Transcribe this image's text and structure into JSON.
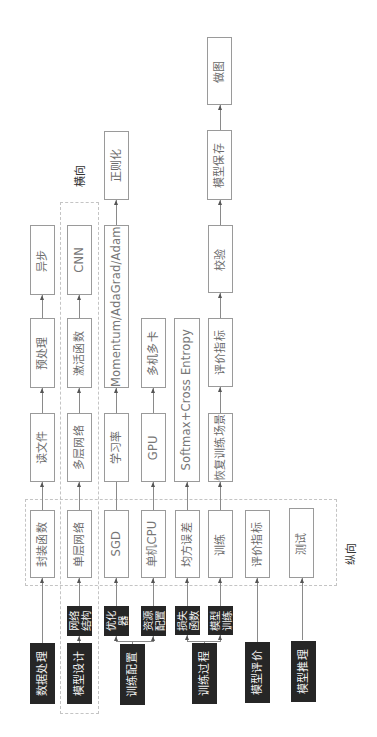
{
  "direction_labels": {
    "horizontal": "横向",
    "vertical": "纵向"
  },
  "columns": [
    {
      "category": "数据处理",
      "steps": [
        "封装函数",
        "读文件",
        "预处理",
        "异步"
      ]
    },
    {
      "category": "模型设计",
      "sub": "网络结构",
      "steps": [
        "单层网络",
        "多层网络",
        "激活函数",
        "CNN"
      ]
    },
    {
      "category": "训练配置",
      "sub": "优化器",
      "steps": [
        "SGD",
        "学习率",
        "Momentum/AdaGrad/Adam",
        "正则化"
      ]
    },
    {
      "category": "训练配置",
      "sub": "资源配置",
      "steps": [
        "单机CPU",
        "GPU",
        "多机多卡"
      ]
    },
    {
      "category": "训练过程",
      "sub": "损失函数",
      "steps": [
        "均方误差",
        "Softmax+Cross Entropy"
      ]
    },
    {
      "category": "训练过程",
      "sub": "模型训练",
      "steps": [
        "训练",
        "恢复训练场景",
        "评价指标",
        "校验",
        "模型保存",
        "做图"
      ]
    },
    {
      "category": "模型评价",
      "steps": [
        "评价指标"
      ]
    },
    {
      "category": "模型推理",
      "steps": [
        "测试"
      ]
    }
  ],
  "dark": {
    "data_processing": "数据处理",
    "model_design": "模型设计",
    "network_structure": "网络结构",
    "optimizer": "优化器",
    "resource_config": "资源配置",
    "training_config": "训练配置",
    "loss_function": "损失函数",
    "model_training": "模型训练",
    "training_process": "训练过程",
    "model_evaluation": "模型评价",
    "model_inference": "模型推理"
  },
  "colors": {
    "dark_box": "#262626",
    "border": "#9a9a9a",
    "dashed": "#c4c4c4",
    "line": "#8a8a8a"
  }
}
